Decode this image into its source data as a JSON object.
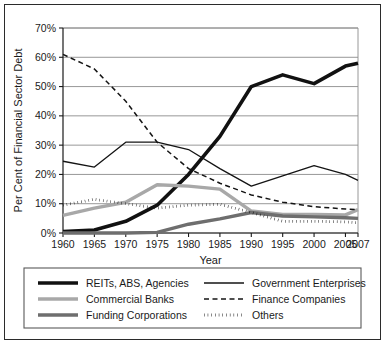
{
  "chart_data": {
    "type": "line",
    "title": "",
    "xlabel": "Year",
    "ylabel": "Per Cent of Financial Sector Debt",
    "x": [
      1960,
      1965,
      1970,
      1975,
      1980,
      1985,
      1990,
      1995,
      2000,
      2005,
      2007
    ],
    "xtick_labels": [
      "1960",
      "1965",
      "1970",
      "1975",
      "1980",
      "1985",
      "1990",
      "1995",
      "2000",
      "2005",
      "2007"
    ],
    "ytick_labels": [
      "0%",
      "10%",
      "20%",
      "30%",
      "40%",
      "50%",
      "60%",
      "70%"
    ],
    "ytick_values": [
      0,
      10,
      20,
      30,
      40,
      50,
      60,
      70
    ],
    "xlim": [
      1960,
      2007
    ],
    "ylim": [
      0,
      70
    ],
    "grid": "horizontal",
    "legend_position": "bottom",
    "legend_columns": 2,
    "series": [
      {
        "name": "REITs, ABS, Agencies",
        "values": [
          0.5,
          1.0,
          4.0,
          9.5,
          20.0,
          33.0,
          50.0,
          54.0,
          51.0,
          57.0,
          58.0
        ],
        "color": "#111111",
        "width": 3.6,
        "dash": "none"
      },
      {
        "name": "Commercial Banks",
        "values": [
          6.0,
          8.5,
          10.5,
          16.5,
          16.0,
          15.0,
          7.5,
          6.3,
          6.3,
          6.2,
          8.0
        ],
        "color": "#a8a8a8",
        "width": 3.4,
        "dash": "none"
      },
      {
        "name": "Funding Corporations",
        "values": [
          0.0,
          0.0,
          0.0,
          0.2,
          3.0,
          4.8,
          7.0,
          5.8,
          5.5,
          5.2,
          5.0
        ],
        "color": "#6e6e6e",
        "width": 3.4,
        "dash": "none"
      },
      {
        "name": "Government Enterprises",
        "values": [
          24.5,
          22.5,
          31.0,
          31.0,
          28.5,
          22.0,
          16.0,
          19.5,
          23.0,
          20.0,
          18.0
        ],
        "color": "#141414",
        "width": 1.3,
        "dash": "none"
      },
      {
        "name": "Finance Companies",
        "values": [
          61.0,
          56.0,
          45.0,
          31.0,
          22.0,
          17.0,
          13.0,
          10.5,
          9.0,
          8.2,
          8.0
        ],
        "color": "#141414",
        "width": 1.5,
        "dash": "5,3.5"
      },
      {
        "name": "Others",
        "values": [
          9.5,
          11.5,
          10.0,
          8.5,
          9.5,
          9.8,
          7.0,
          4.0,
          4.0,
          3.8,
          3.5
        ],
        "color": "#141414",
        "width": 2.8,
        "dash": "0.5,3.2"
      }
    ]
  },
  "legend": {
    "entries": [
      {
        "label": "REITs, ABS, Agencies",
        "series_index": 0
      },
      {
        "label": "Government Enterprises",
        "series_index": 3
      },
      {
        "label": "Commercial Banks",
        "series_index": 1
      },
      {
        "label": "Finance Companies",
        "series_index": 4
      },
      {
        "label": "Funding Corporations",
        "series_index": 2
      },
      {
        "label": "Others",
        "series_index": 5
      }
    ]
  }
}
